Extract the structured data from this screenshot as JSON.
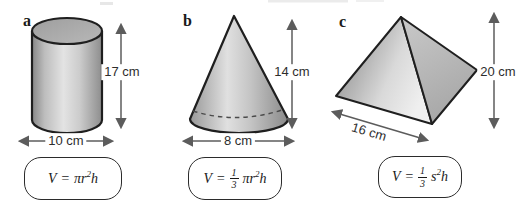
{
  "colors": {
    "outline": "#1f1f1f",
    "arrow": "#5c5c5c",
    "text": "#2d2d2d",
    "box_border": "#2b2b2b",
    "shade_dark": "#8a8a8a",
    "shade_light": "#e8e8e8"
  },
  "figures": [
    {
      "letter": "a",
      "shape": "cylinder",
      "height_label": "17 cm",
      "base_label": "10 cm",
      "formula": {
        "lhs": "V",
        "op": "=",
        "term": "πr",
        "sup": "2",
        "tail": "h"
      }
    },
    {
      "letter": "b",
      "shape": "cone",
      "height_label": "14 cm",
      "base_label": "8 cm",
      "formula": {
        "lhs": "V",
        "op": "=",
        "num": "1",
        "den": "3",
        "term": "πr",
        "sup": "2",
        "tail": "h"
      }
    },
    {
      "letter": "c",
      "shape": "pyramid",
      "height_label": "20 cm",
      "base_label": "16 cm",
      "formula": {
        "lhs": "V",
        "op": "=",
        "num": "1",
        "den": "3",
        "term": "s",
        "sup": "2",
        "tail": "h"
      }
    }
  ]
}
